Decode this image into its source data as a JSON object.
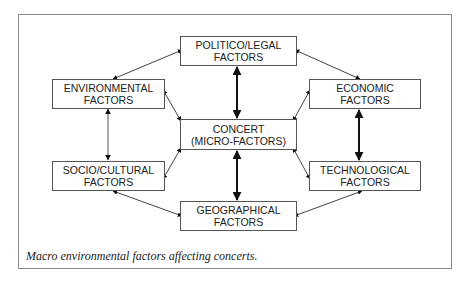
{
  "figure": {
    "caption": "Macro environmental factors affecting concerts.",
    "nodes": {
      "politico_legal": {
        "line1": "POLITICO/LEGAL",
        "line2": "FACTORS"
      },
      "environmental": {
        "line1": "ENVIRONMENTAL",
        "line2": "FACTORS"
      },
      "economic": {
        "line1": "ECONOMIC",
        "line2": "FACTORS"
      },
      "concert": {
        "line1": "CONCERT",
        "line2": "(MICRO-FACTORS)"
      },
      "socio_cultural": {
        "line1": "SOCIO/CULTURAL",
        "line2": "FACTORS"
      },
      "technological": {
        "line1": "TECHNOLOGICAL",
        "line2": "FACTORS"
      },
      "geographical": {
        "line1": "GEOGRAPHICAL",
        "line2": "FACTORS"
      }
    },
    "edges": [
      {
        "from": "politico_legal",
        "to": "concert",
        "style": "bold",
        "direction": "both"
      },
      {
        "from": "concert",
        "to": "geographical",
        "style": "bold",
        "direction": "both"
      },
      {
        "from": "economic",
        "to": "technological",
        "style": "bold",
        "direction": "both"
      },
      {
        "from": "environmental",
        "to": "socio_cultural",
        "style": "thin",
        "direction": "both"
      },
      {
        "from": "politico_legal",
        "to": "environmental",
        "style": "thin",
        "direction": "both"
      },
      {
        "from": "politico_legal",
        "to": "economic",
        "style": "thin",
        "direction": "both"
      },
      {
        "from": "environmental",
        "to": "concert",
        "style": "thin",
        "direction": "both"
      },
      {
        "from": "economic",
        "to": "concert",
        "style": "thin",
        "direction": "both"
      },
      {
        "from": "socio_cultural",
        "to": "concert",
        "style": "thin",
        "direction": "both"
      },
      {
        "from": "technological",
        "to": "concert",
        "style": "thin",
        "direction": "both"
      },
      {
        "from": "socio_cultural",
        "to": "geographical",
        "style": "thin",
        "direction": "both"
      },
      {
        "from": "technological",
        "to": "geographical",
        "style": "thin",
        "direction": "both"
      }
    ]
  }
}
